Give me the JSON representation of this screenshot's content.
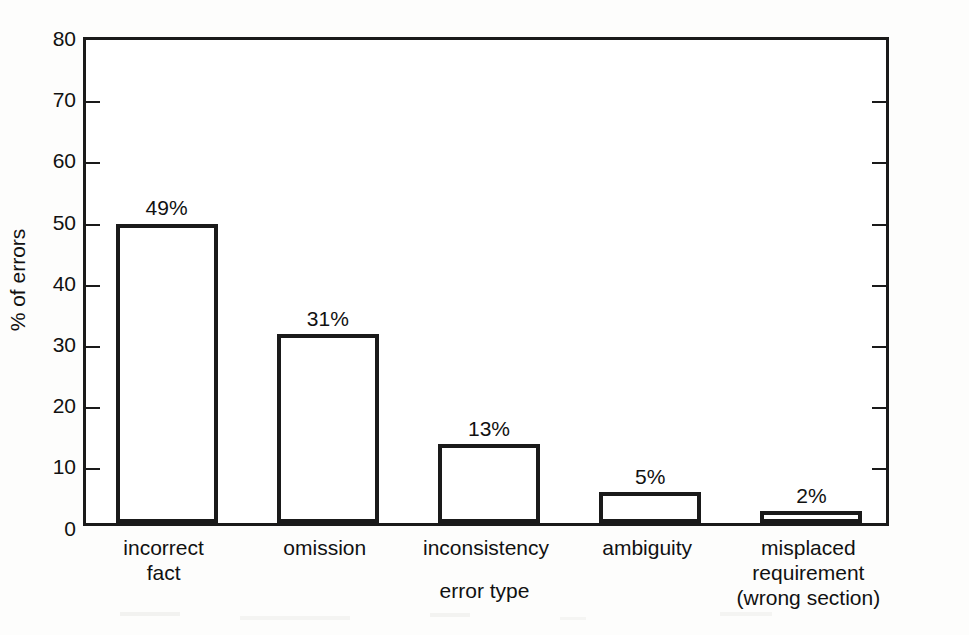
{
  "chart_data": {
    "type": "bar",
    "title": "",
    "xlabel": "error type",
    "ylabel": "% of errors",
    "categories": [
      "incorrect\nfact",
      "omission",
      "inconsistency",
      "ambiguity",
      "misplaced\nrequirement\n(wrong section)"
    ],
    "values": [
      49,
      31,
      13,
      5,
      2
    ],
    "data_labels": [
      "49%",
      "31%",
      "13%",
      "5%",
      "2%"
    ],
    "ylim": [
      0,
      80
    ],
    "ytick_labels": [
      "0",
      "10",
      "20",
      "30",
      "40",
      "50",
      "60",
      "70",
      "80"
    ],
    "ytick_values": [
      0,
      10,
      20,
      30,
      40,
      50,
      60,
      70,
      80
    ],
    "grid": false,
    "legend": false,
    "bar_fill_color": "#ffffff",
    "bar_edge_color": "#1a1a1a",
    "axis_color": "#1a1a1a",
    "text_color": "#111111",
    "background_color": "#fdfdfc"
  }
}
